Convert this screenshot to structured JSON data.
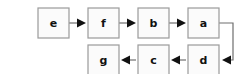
{
  "diagram": {
    "type": "flowchart",
    "title": "",
    "canvas": {
      "width": 241,
      "height": 74
    },
    "style": {
      "background_color": "#ffffff",
      "node_fill": "#fbfbfb",
      "node_stroke": "#9a9a9a",
      "node_stroke_width": 1.2,
      "edge_color": "#6e6e6e",
      "arrowhead_color": "#111111",
      "label_color": "#111111"
    },
    "nodes": [
      {
        "id": "e",
        "label": "e",
        "x": 38,
        "y": 8,
        "w": 31,
        "h": 30,
        "row": "top"
      },
      {
        "id": "f",
        "label": "f",
        "x": 88,
        "y": 8,
        "w": 31,
        "h": 30,
        "row": "top"
      },
      {
        "id": "b",
        "label": "b",
        "x": 138,
        "y": 8,
        "w": 31,
        "h": 30,
        "row": "top"
      },
      {
        "id": "a",
        "label": "a",
        "x": 188,
        "y": 8,
        "w": 31,
        "h": 30,
        "row": "top"
      },
      {
        "id": "g",
        "label": "g",
        "x": 88,
        "y": 45,
        "w": 31,
        "h": 30,
        "row": "bottom"
      },
      {
        "id": "c",
        "label": "c",
        "x": 138,
        "y": 45,
        "w": 31,
        "h": 30,
        "row": "bottom"
      },
      {
        "id": "d",
        "label": "d",
        "x": 188,
        "y": 45,
        "w": 31,
        "h": 30,
        "row": "bottom"
      }
    ],
    "edges": [
      {
        "id": "e-f",
        "from": "e",
        "to": "f",
        "direction": "right",
        "path": "M 69 23 L 84 23",
        "arrow_at": [
          86,
          23
        ],
        "arrow_dir": "right"
      },
      {
        "id": "f-b",
        "from": "f",
        "to": "b",
        "direction": "right",
        "path": "M 119 23 L 134 23",
        "arrow_at": [
          136,
          23
        ],
        "arrow_dir": "right"
      },
      {
        "id": "b-a",
        "from": "b",
        "to": "a",
        "direction": "right",
        "path": "M 169 23 L 184 23",
        "arrow_at": [
          186,
          23
        ],
        "arrow_dir": "right"
      },
      {
        "id": "a-d",
        "from": "a",
        "to": "d",
        "direction": "loop-right",
        "path": "M 219 23 L 233 23 L 233 60 L 224 60",
        "arrow_at": [
          222,
          60
        ],
        "arrow_dir": "left",
        "mid_arrow_at": [
          213,
          23
        ],
        "mid_arrow_dir": "right"
      },
      {
        "id": "d-c",
        "from": "d",
        "to": "c",
        "direction": "left",
        "path": "M 186 60 L 173 60",
        "arrow_at": [
          171,
          60
        ],
        "arrow_dir": "left"
      },
      {
        "id": "c-g",
        "from": "c",
        "to": "g",
        "direction": "left",
        "path": "M 136 60 L 123 60",
        "arrow_at": [
          121,
          60
        ],
        "arrow_dir": "left"
      }
    ]
  }
}
